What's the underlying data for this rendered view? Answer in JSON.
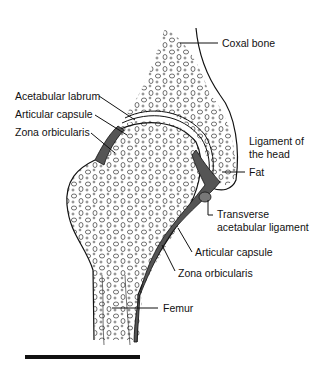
{
  "diagram": {
    "labels": {
      "coxal_bone": "Coxal bone",
      "acetabular_labrum": "Acetabular labrum",
      "articular_capsule_top": "Articular capsule",
      "zona_orbicularis_top": "Zona orbicularis",
      "ligament_of_head_1": "Ligament of",
      "ligament_of_head_2": "the head",
      "fat": "Fat",
      "transverse_1": "Transverse",
      "transverse_2": "acetabular ligament",
      "articular_capsule_bottom": "Articular capsule",
      "zona_orbicularis_bottom": "Zona orbicularis",
      "femur": "Femur"
    },
    "colors": {
      "line": "#111111",
      "ligament_fill": "#555555",
      "background": "#ffffff"
    }
  }
}
